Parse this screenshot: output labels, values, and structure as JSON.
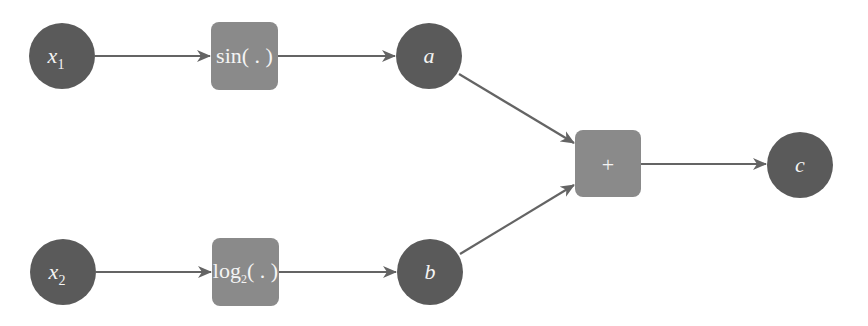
{
  "diagram": {
    "type": "computational-graph",
    "colors": {
      "variable_node": "#5a5a5a",
      "operation_node": "#8a8a8a",
      "edge": "#646464",
      "label": "#f4f4f4",
      "background": "#ffffff"
    },
    "nodes": {
      "x1": {
        "kind": "variable",
        "label": "x",
        "subscript": "1"
      },
      "sin": {
        "kind": "operation",
        "label": "sin( . )"
      },
      "a": {
        "kind": "variable",
        "label": "a"
      },
      "x2": {
        "kind": "variable",
        "label": "x",
        "subscript": "2"
      },
      "log": {
        "kind": "operation",
        "label": "log",
        "subscript": "2",
        "suffix": "( . )"
      },
      "b": {
        "kind": "variable",
        "label": "b"
      },
      "plus": {
        "kind": "operation",
        "label": "+"
      },
      "c": {
        "kind": "variable",
        "label": "c"
      }
    },
    "edges": [
      {
        "from": "x1",
        "to": "sin"
      },
      {
        "from": "sin",
        "to": "a"
      },
      {
        "from": "a",
        "to": "plus"
      },
      {
        "from": "x2",
        "to": "log"
      },
      {
        "from": "log",
        "to": "b"
      },
      {
        "from": "b",
        "to": "plus"
      },
      {
        "from": "plus",
        "to": "c"
      }
    ]
  }
}
